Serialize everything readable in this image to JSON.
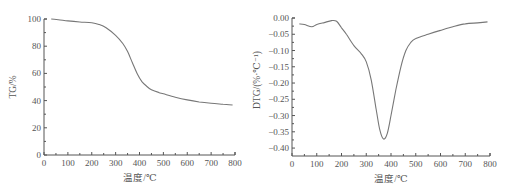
{
  "chart_data": [
    {
      "type": "line",
      "title": "",
      "xlabel": "温度/℃",
      "ylabel": "TG/%",
      "xlim": [
        0,
        800
      ],
      "ylim": [
        0,
        100
      ],
      "x_ticks": [
        0,
        100,
        200,
        300,
        400,
        500,
        600,
        700,
        800
      ],
      "y_ticks": [
        0,
        20,
        40,
        60,
        80,
        100
      ],
      "grid": false,
      "legend": null,
      "series": [
        {
          "name": "TG",
          "x": [
            30,
            60,
            100,
            150,
            200,
            230,
            260,
            300,
            330,
            350,
            370,
            390,
            410,
            430,
            450,
            480,
            500,
            550,
            600,
            650,
            700,
            750,
            790
          ],
          "y": [
            100,
            99.5,
            98.6,
            97.8,
            97.2,
            96,
            93.5,
            88,
            82,
            76,
            68,
            60,
            54,
            50.5,
            48,
            46,
            45,
            42.5,
            40.5,
            39,
            38,
            37.3,
            36.8
          ]
        }
      ]
    },
    {
      "type": "line",
      "title": "",
      "xlabel": "温度/℃",
      "ylabel": "DTG/(%·℃⁻¹)",
      "xlim": [
        0,
        800
      ],
      "ylim": [
        -0.42,
        0.0
      ],
      "x_ticks": [
        0,
        100,
        200,
        300,
        400,
        500,
        600,
        700,
        800
      ],
      "y_ticks": [
        0.0,
        -0.05,
        -0.1,
        -0.15,
        -0.2,
        -0.25,
        -0.3,
        -0.35,
        -0.4
      ],
      "grid": false,
      "legend": null,
      "series": [
        {
          "name": "DTG",
          "x": [
            30,
            50,
            80,
            100,
            130,
            160,
            180,
            200,
            220,
            250,
            280,
            300,
            320,
            340,
            355,
            370,
            385,
            400,
            420,
            440,
            460,
            480,
            500,
            550,
            600,
            650,
            700,
            750,
            790
          ],
          "y": [
            -0.018,
            -0.02,
            -0.027,
            -0.02,
            -0.014,
            -0.008,
            -0.01,
            -0.03,
            -0.05,
            -0.085,
            -0.11,
            -0.135,
            -0.19,
            -0.28,
            -0.345,
            -0.372,
            -0.355,
            -0.3,
            -0.22,
            -0.15,
            -0.1,
            -0.075,
            -0.063,
            -0.05,
            -0.038,
            -0.027,
            -0.018,
            -0.015,
            -0.012
          ]
        }
      ]
    }
  ],
  "charts": {
    "tg": {
      "ylabel": "TG/%",
      "xlabel": "温度/℃",
      "y_tick_labels": [
        "0",
        "20",
        "40",
        "60",
        "80",
        "100"
      ],
      "x_tick_labels": [
        "0",
        "100",
        "200",
        "300",
        "400",
        "500",
        "600",
        "700",
        "800"
      ]
    },
    "dtg": {
      "ylabel": "DTG/(%·℃⁻¹)",
      "xlabel": "温度/℃",
      "y_tick_labels": [
        "0.00",
        "−0.05",
        "−0.10",
        "−0.15",
        "−0.20",
        "−0.25",
        "−0.30",
        "−0.35",
        "−0.40"
      ],
      "x_tick_labels": [
        "0",
        "100",
        "200",
        "300",
        "400",
        "500",
        "600",
        "700",
        "800"
      ]
    }
  }
}
